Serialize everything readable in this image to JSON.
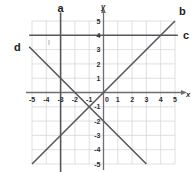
{
  "chart_data": {
    "type": "line",
    "title": "",
    "xlabel": "x",
    "ylabel": "y",
    "xlim": [
      -5,
      5
    ],
    "ylim": [
      -5,
      5
    ],
    "grid": true,
    "legend": "none",
    "x_ticks": [
      "-5",
      "-4",
      "-3",
      "-2",
      "-1",
      "0",
      "1",
      "2",
      "3",
      "4",
      "5"
    ],
    "y_ticks": [
      "5",
      "4",
      "3",
      "2",
      "1",
      "-1",
      "-2",
      "-3",
      "-4",
      "-5"
    ],
    "origin_label": "0",
    "series": [
      {
        "name": "a",
        "label": "a",
        "description": "vertical line x = -3",
        "equation": "x = -3",
        "x": [
          -3,
          -3
        ],
        "y": [
          5.6,
          -5.6
        ],
        "label_x": -3,
        "label_y": 6.2
      },
      {
        "name": "b",
        "label": "b",
        "description": "line through origin with slope 1",
        "equation": "y = x",
        "x": [
          -5,
          5
        ],
        "y": [
          -5,
          5
        ],
        "label_x": 5.3,
        "label_y": 5.6
      },
      {
        "name": "c",
        "label": "c",
        "description": "horizontal line y = 4",
        "equation": "y = 4",
        "x": [
          -5.2,
          5.2
        ],
        "y": [
          4,
          4
        ],
        "label_x": 5.9,
        "label_y": 4
      },
      {
        "name": "d",
        "label": "d",
        "description": "line with slope -1 and y-intercept -2",
        "equation": "y = -x - 2",
        "x": [
          -5.2,
          3
        ],
        "y": [
          3.2,
          -5
        ],
        "label_x": -6.0,
        "label_y": 3.5
      }
    ]
  },
  "axes": {
    "x_axis_label": "x",
    "y_axis_label": "y"
  }
}
